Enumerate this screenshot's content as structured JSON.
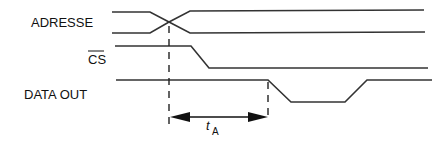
{
  "diagram": {
    "type": "timing-diagram",
    "signals": [
      {
        "id": "adresse",
        "label": "ADRESSE",
        "overline": false
      },
      {
        "id": "cs",
        "label": "CS",
        "overline": true
      },
      {
        "id": "data_out",
        "label": "DATA OUT",
        "overline": false
      }
    ],
    "timing": {
      "label_main": "t",
      "label_sub": "A",
      "description": "Access time from address change to data out valid"
    },
    "colors": {
      "line": "#333333",
      "text": "#111111",
      "background": "#ffffff"
    }
  }
}
